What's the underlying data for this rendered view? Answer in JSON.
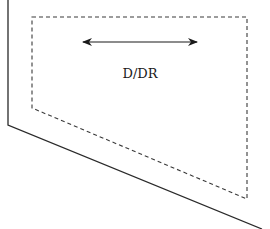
{
  "diagram": {
    "label": "D/DR",
    "colors": {
      "stroke": "#2a2a2a",
      "dashed": "#3a3a3a",
      "text": "#1a1a1a",
      "background": "#ffffff"
    },
    "elements": [
      {
        "type": "solid-boundary",
        "description": "outer wall line: vertical then slanted"
      },
      {
        "type": "dashed-region",
        "description": "dashed polygon zone"
      },
      {
        "type": "double-arrow",
        "description": "horizontal bidirectional arrow"
      },
      {
        "type": "text-label",
        "text": "D/DR"
      }
    ]
  }
}
